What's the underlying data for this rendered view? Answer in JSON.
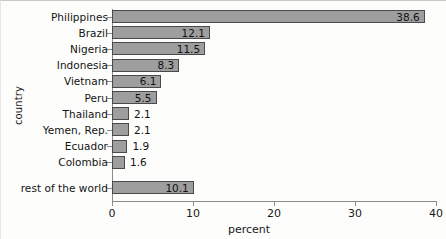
{
  "chart_data": {
    "type": "bar",
    "orientation": "horizontal",
    "title": "",
    "xlabel": "percent",
    "ylabel": "country",
    "xlim": [
      0,
      40
    ],
    "xticks": [
      0,
      10,
      20,
      30,
      40
    ],
    "xtick_labels": [
      "0",
      "10",
      "20",
      "30",
      "40"
    ],
    "grid": false,
    "legend": null,
    "categories": [
      "Philippines",
      "Brazil",
      "Nigeria",
      "Indonesia",
      "Vietnam",
      "Peru",
      "Thailand",
      "Yemen, Rep.",
      "Ecuador",
      "Colombia",
      "rest of the world"
    ],
    "values": [
      38.6,
      12.1,
      11.5,
      8.3,
      6.1,
      5.5,
      2.1,
      2.1,
      1.9,
      1.6,
      10.1
    ],
    "value_labels": [
      "38.6",
      "12.1",
      "11.5",
      "8.3",
      "6.1",
      "5.5",
      "2.1",
      "2.1",
      "1.9",
      "1.6",
      "10.1"
    ],
    "bar_color": "#9e9e9e",
    "bar_edge_color": "#4a4a4a",
    "text_color": "#111111"
  }
}
